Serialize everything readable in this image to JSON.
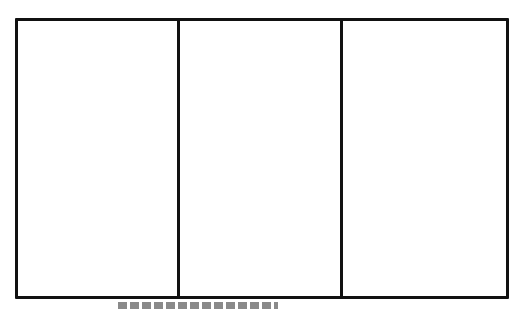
{
  "diagram": {
    "type": "three-panel-layout",
    "panel_count": 3,
    "panels": [
      {
        "label": "",
        "content": ""
      },
      {
        "label": "",
        "content": ""
      },
      {
        "label": "",
        "content": ""
      }
    ],
    "colors": {
      "border": "#111111",
      "background": "#ffffff"
    },
    "caption": {
      "text": "",
      "note": "caption present below frame but cropped; text illegible"
    }
  }
}
